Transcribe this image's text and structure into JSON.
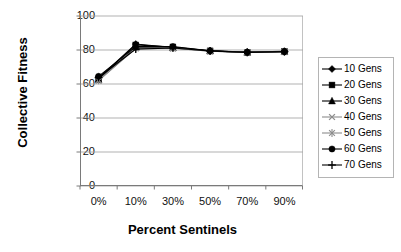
{
  "chart_data": {
    "type": "line",
    "title": "",
    "xlabel": "Percent Sentinels",
    "ylabel": "Collective Fitness",
    "categories": [
      "0%",
      "10%",
      "30%",
      "50%",
      "70%",
      "90%"
    ],
    "ylim": [
      0,
      100
    ],
    "yticks": [
      0,
      20,
      40,
      60,
      80,
      100
    ],
    "grid": "horizontal",
    "legend_position": "right",
    "series": [
      {
        "name": "10 Gens",
        "marker": "diamond",
        "color": "#000000",
        "values": [
          63.5,
          83.5,
          81.5,
          79.6,
          78.8,
          79.2
        ]
      },
      {
        "name": "20 Gens",
        "marker": "square",
        "color": "#000000",
        "values": [
          63.0,
          83.0,
          81.8,
          79.5,
          78.7,
          79.1
        ]
      },
      {
        "name": "30 Gens",
        "marker": "triangle",
        "color": "#000000",
        "values": [
          62.5,
          81.5,
          81.3,
          79.4,
          78.6,
          79.0
        ]
      },
      {
        "name": "40 Gens",
        "marker": "x",
        "color": "#8c8c8c",
        "values": [
          62.0,
          81.0,
          81.0,
          79.3,
          78.6,
          79.0
        ]
      },
      {
        "name": "50 Gens",
        "marker": "star",
        "color": "#8c8c8c",
        "values": [
          62.2,
          81.2,
          81.1,
          79.3,
          78.6,
          79.0
        ]
      },
      {
        "name": "60 Gens",
        "marker": "circle",
        "color": "#000000",
        "values": [
          64.5,
          82.0,
          82.0,
          79.5,
          78.7,
          79.1
        ]
      },
      {
        "name": "70 Gens",
        "marker": "plus",
        "color": "#000000",
        "values": [
          63.8,
          80.5,
          81.2,
          79.4,
          78.6,
          79.0
        ]
      }
    ]
  },
  "axes": {
    "ytick_labels": [
      "100",
      "80",
      "60",
      "40",
      "20",
      "0"
    ],
    "xtick_labels": [
      "0%",
      "10%",
      "30%",
      "50%",
      "70%",
      "90%"
    ],
    "y_axis_title": "Collective Fitness",
    "x_axis_title": "Percent Sentinels"
  },
  "legend": {
    "items": [
      {
        "label": "10 Gens"
      },
      {
        "label": "20 Gens"
      },
      {
        "label": "30 Gens"
      },
      {
        "label": "40 Gens"
      },
      {
        "label": "50 Gens"
      },
      {
        "label": "60 Gens"
      },
      {
        "label": "70 Gens"
      }
    ]
  },
  "colors": {
    "grid": "#a8a8a8",
    "axis": "#7a7a7a",
    "series_dark": "#000000",
    "series_gray": "#8c8c8c",
    "background": "#ffffff"
  }
}
